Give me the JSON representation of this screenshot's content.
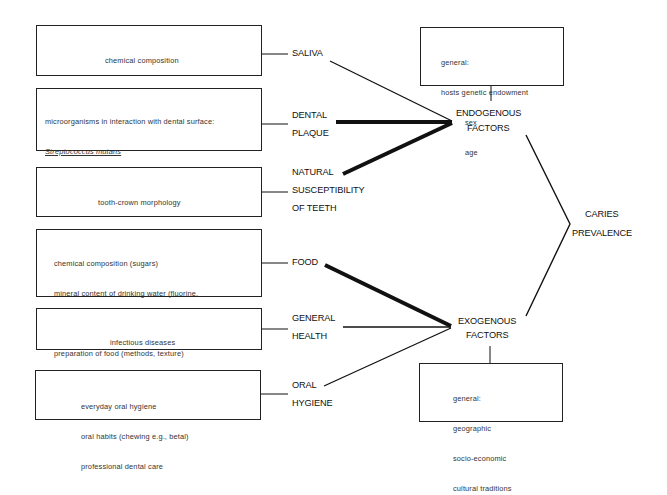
{
  "factors": [
    {
      "id": "saliva",
      "label_lines": [
        "SALIVA"
      ],
      "details": [
        "chemical composition",
        "flow rate",
        "buffering capacity"
      ],
      "group": "endogenous",
      "line_weight": "thin"
    },
    {
      "id": "dental-plaque",
      "label_lines": [
        "DENTAL",
        "PLAQUE"
      ],
      "details": [
        "microorganisms in interaction with dental surface:",
        "Streptococcus mutans",
        "Lactobacillus acidophilus",
        "Streptococcus salivarius",
        "Actinomyces viscosus"
      ],
      "group": "endogenous",
      "line_weight": "thick"
    },
    {
      "id": "natural-susceptibility",
      "label_lines": [
        "NATURAL",
        "SUSCEPTIBILITY",
        "OF TEETH"
      ],
      "details": [
        "tooth-crown morphology",
        "enamel integrity",
        "dental wear"
      ],
      "group": "endogenous",
      "line_weight": "thick"
    },
    {
      "id": "food",
      "label_lines": [
        "FOOD"
      ],
      "details": [
        "chemical composition (sugars)",
        "mineral content of drinking water (fluorine,",
        "phosphorus, strontium)",
        "preparation of food (methods, texture)",
        "frequency of food intake"
      ],
      "group": "exogenous",
      "line_weight": "thick"
    },
    {
      "id": "general-health",
      "label_lines": [
        "GENERAL",
        "HEALTH"
      ],
      "details": [
        "infectious diseases",
        "metabolic disorders"
      ],
      "group": "exogenous",
      "line_weight": "thin"
    },
    {
      "id": "oral-hygiene",
      "label_lines": [
        "ORAL",
        "HYGIENE"
      ],
      "details": [
        "everyday oral hygiene",
        "oral habits (chewing e.g., betal)",
        "professional dental care"
      ],
      "group": "exogenous",
      "line_weight": "thin"
    }
  ],
  "endogenous": {
    "label_lines": [
      "ENDOGENOUS",
      "FACTORS"
    ],
    "details": [
      "general:",
      "hosts genetic endowment",
      "sex",
      "age"
    ]
  },
  "exogenous": {
    "label_lines": [
      "EXOGENOUS",
      "FACTORS"
    ],
    "details": [
      "general:",
      "geographic",
      "socio-economic",
      "cultural traditions"
    ]
  },
  "outcome": {
    "label_lines": [
      "CARIES",
      "PREVALENCE"
    ]
  },
  "colors": {
    "line": "#111111",
    "box_border": "#222222",
    "text": "#333333",
    "background": "#ffffff"
  }
}
